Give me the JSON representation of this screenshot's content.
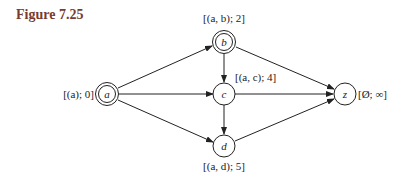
{
  "figure": {
    "title": "Figure 7.25"
  },
  "graph": {
    "nodes": [
      {
        "id": "a",
        "label": "a",
        "annotation": "[(a); 0]",
        "double": true
      },
      {
        "id": "b",
        "label": "b",
        "annotation": "[(a, b); 2]",
        "double": true
      },
      {
        "id": "c",
        "label": "c",
        "annotation": "[(a, c); 4]",
        "double": false
      },
      {
        "id": "d",
        "label": "d",
        "annotation": "[(a, d); 5]",
        "double": false
      },
      {
        "id": "z",
        "label": "z",
        "annotation": "[Ø; ∞]",
        "double": false
      }
    ],
    "edges": [
      {
        "from": "a",
        "to": "b"
      },
      {
        "from": "a",
        "to": "c"
      },
      {
        "from": "a",
        "to": "d"
      },
      {
        "from": "b",
        "to": "c"
      },
      {
        "from": "b",
        "to": "z"
      },
      {
        "from": "c",
        "to": "z"
      },
      {
        "from": "c",
        "to": "d"
      },
      {
        "from": "d",
        "to": "z"
      }
    ]
  }
}
